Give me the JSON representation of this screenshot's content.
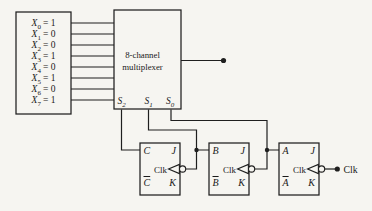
{
  "colors": {
    "background": "#f6f5f1",
    "line": "#1f1f1f",
    "text": "#1a1a1a"
  },
  "input_box": {
    "rows": [
      {
        "var": "X",
        "sub": "0",
        "eq": "= 1"
      },
      {
        "var": "X",
        "sub": "1",
        "eq": "= 0"
      },
      {
        "var": "X",
        "sub": "2",
        "eq": "= 0"
      },
      {
        "var": "X",
        "sub": "3",
        "eq": "= 1"
      },
      {
        "var": "X",
        "sub": "4",
        "eq": "= 0"
      },
      {
        "var": "X",
        "sub": "5",
        "eq": "= 1"
      },
      {
        "var": "X",
        "sub": "6",
        "eq": "= 0"
      },
      {
        "var": "X",
        "sub": "7",
        "eq": "= 1"
      }
    ]
  },
  "multiplexer": {
    "label_line1": "8-channel",
    "label_line2": "multiplexer",
    "selects": [
      {
        "var": "S",
        "sub": "2"
      },
      {
        "var": "S",
        "sub": "1"
      },
      {
        "var": "S",
        "sub": "0"
      }
    ]
  },
  "flip_flops": [
    {
      "output": "C",
      "output_bar": "C",
      "j": "J",
      "k": "K",
      "clk": "Clk"
    },
    {
      "output": "B",
      "output_bar": "B",
      "j": "J",
      "k": "K",
      "clk": "Clk"
    },
    {
      "output": "A",
      "output_bar": "A",
      "j": "J",
      "k": "K",
      "clk": "Clk"
    }
  ],
  "external_clock_label": "Clk"
}
